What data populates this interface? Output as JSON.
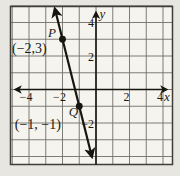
{
  "page": {
    "margin_letter": "e"
  },
  "colors": {
    "page_bg": "#e8e6e0",
    "plot_bg": "#f5f4ef",
    "grid": "#6f6e66",
    "border": "#3f3e38",
    "ink": "#16150f",
    "text": "#1b1a14"
  },
  "chart_data": {
    "type": "line",
    "title": "",
    "xlabel": "x",
    "ylabel": "y",
    "xlim": [
      -5,
      4.6
    ],
    "ylim": [
      -4.5,
      5
    ],
    "grid": true,
    "x_ticks": [
      {
        "value": -4,
        "label": "−4"
      },
      {
        "value": -2,
        "label": "−2"
      },
      {
        "value": 2,
        "label": "2"
      },
      {
        "value": 4,
        "label": "4"
      }
    ],
    "y_ticks": [
      {
        "value": -2,
        "label": "−2"
      },
      {
        "value": 2,
        "label": "2"
      },
      {
        "value": 4,
        "label": "4"
      }
    ],
    "points": [
      {
        "name": "P",
        "x": -2,
        "y": 3,
        "coord_label": "(−2,3)"
      },
      {
        "name": "Q",
        "x": -1,
        "y": -1,
        "coord_label": "(−1, −1)"
      }
    ],
    "line_through": [
      "P",
      "Q"
    ]
  }
}
